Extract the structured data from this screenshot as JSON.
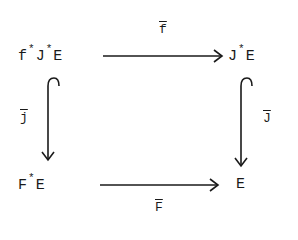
{
  "diagram": {
    "type": "commutative-square",
    "nodes": {
      "top_left": {
        "base1": "f",
        "sup1": "*",
        "base2": "J",
        "sup2": "*",
        "base3": "E"
      },
      "top_right": {
        "base1": "J",
        "sup1": "*",
        "base2": "E"
      },
      "bottom_left": {
        "base1": "F",
        "sup1": "*",
        "base2": "E"
      },
      "bottom_right": {
        "base1": "E"
      }
    },
    "arrows": {
      "top": {
        "label": "f",
        "from": "f*J*E",
        "to": "J*E",
        "style": "arrow"
      },
      "bottom": {
        "label": "F",
        "from": "F*E",
        "to": "E",
        "style": "arrow"
      },
      "left": {
        "label": "j",
        "from": "f*J*E",
        "to": "F*E",
        "style": "hook-arrow"
      },
      "right": {
        "label": "J",
        "from": "J*E",
        "to": "E",
        "style": "hook-arrow"
      }
    },
    "ink_color": "#1a1a1a"
  }
}
